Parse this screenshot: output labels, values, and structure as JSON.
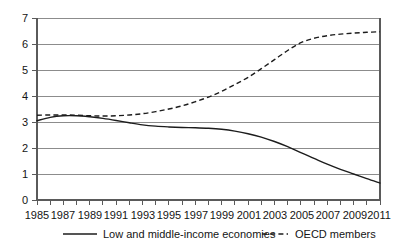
{
  "chart_data": {
    "type": "line",
    "title": "",
    "subtitle": "",
    "xlabel": "",
    "ylabel": "",
    "xlim": [
      1985,
      2011
    ],
    "ylim": [
      0,
      7
    ],
    "grid": true,
    "grid_axis": "y",
    "legend_position": "bottom",
    "y_ticks": [
      "0",
      "1",
      "2",
      "3",
      "4",
      "5",
      "6",
      "7"
    ],
    "y_tick_values": [
      0,
      1,
      2,
      3,
      4,
      5,
      6,
      7
    ],
    "x_ticks": [
      "1985",
      "1987",
      "1989",
      "1991",
      "1993",
      "1995",
      "1997",
      "1999",
      "2001",
      "2003",
      "2005",
      "2007",
      "2009",
      "2011"
    ],
    "x_tick_values": [
      1985,
      1987,
      1989,
      1991,
      1993,
      1995,
      1997,
      1999,
      2001,
      2003,
      2005,
      2007,
      2009,
      2011
    ],
    "x": [
      1985,
      1986,
      1987,
      1988,
      1989,
      1990,
      1991,
      1992,
      1993,
      1994,
      1995,
      1996,
      1997,
      1998,
      1999,
      2000,
      2001,
      2002,
      2003,
      2004,
      2005,
      2006,
      2007,
      2008,
      2009,
      2010,
      2011
    ],
    "series": [
      {
        "name": "Low and middle-income economies",
        "style": "solid",
        "color": "#1c1c1c",
        "values": [
          3.05,
          3.18,
          3.24,
          3.24,
          3.2,
          3.14,
          3.06,
          2.97,
          2.89,
          2.84,
          2.81,
          2.79,
          2.78,
          2.76,
          2.72,
          2.65,
          2.55,
          2.42,
          2.25,
          2.05,
          1.82,
          1.6,
          1.38,
          1.18,
          1.0,
          0.82,
          0.65
        ]
      },
      {
        "name": "OECD members",
        "style": "dashed",
        "color": "#1c1c1c",
        "values": [
          3.26,
          3.27,
          3.27,
          3.26,
          3.24,
          3.23,
          3.24,
          3.27,
          3.32,
          3.4,
          3.5,
          3.62,
          3.78,
          3.96,
          4.18,
          4.44,
          4.72,
          5.05,
          5.4,
          5.75,
          6.05,
          6.22,
          6.32,
          6.38,
          6.42,
          6.45,
          6.47
        ]
      }
    ],
    "annotations": []
  },
  "legend": {
    "items": [
      {
        "label": "Low and middle-income economies",
        "style": "solid"
      },
      {
        "label": "OECD members",
        "style": "dashed"
      }
    ]
  },
  "colors": {
    "series_stroke": "#1c1c1c",
    "gridline": "#8c8c8c",
    "axis": "#5a5a5a",
    "background": "#ffffff",
    "text": "#141414"
  }
}
